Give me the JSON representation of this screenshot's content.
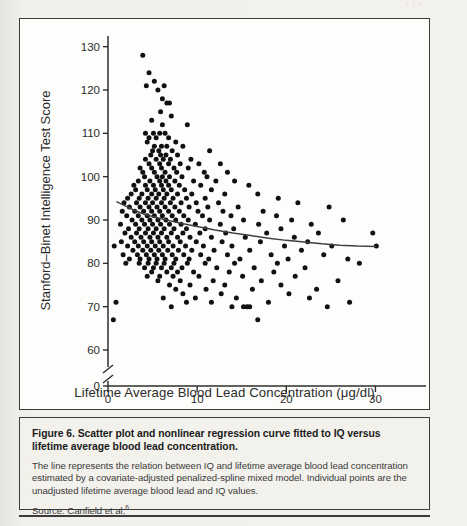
{
  "figure": {
    "bleed_artifact": "f  LP",
    "x_axis_title": "Lifetime Average Blood Lead Concentration (μg/dl)",
    "y_axis_title": "Stanford–Binet Intelligence Test Score"
  },
  "caption": {
    "title": "Figure 6. Scatter plot and nonlinear regression curve fitted to IQ versus lifetime average blood lead concentration.",
    "body": "The line represents the relation between IQ and lifetime average blood lead concentration estimated by a covariate-adjusted penalized-spline mixed model. Individual points are the unadjusted lifetime average blood lead and IQ values.",
    "source_label": "Source: Canfield et al.",
    "source_ref": "6"
  },
  "chart_data": {
    "type": "scatter",
    "title": "Scatter plot and nonlinear regression curve fitted to IQ versus lifetime average blood lead concentration",
    "xlabel": "Lifetime Average Blood Lead Concentration (μg/dl)",
    "ylabel": "Stanford–Binet Intelligence Test Score",
    "xlim": [
      0,
      35
    ],
    "ylim": [
      57,
      132
    ],
    "xticks": [
      0,
      10,
      20,
      30
    ],
    "yticks": [
      60,
      70,
      80,
      90,
      100,
      110,
      120,
      130
    ],
    "y_axis_break": true,
    "y_break_label": "0",
    "grid": false,
    "legend": null,
    "marker": "filled-circle",
    "marker_color": "#111111",
    "line_color": "#404040",
    "n_points": 262,
    "points": [
      [
        3.9,
        128
      ],
      [
        4.6,
        124
      ],
      [
        5.2,
        122
      ],
      [
        4.3,
        121
      ],
      [
        6.3,
        121
      ],
      [
        5.6,
        120
      ],
      [
        6.1,
        118
      ],
      [
        6.6,
        117
      ],
      [
        6.9,
        117
      ],
      [
        5.9,
        115
      ],
      [
        7.1,
        114
      ],
      [
        4.9,
        113
      ],
      [
        6.1,
        112
      ],
      [
        8.9,
        112
      ],
      [
        4.2,
        110
      ],
      [
        5.1,
        110
      ],
      [
        5.8,
        110
      ],
      [
        6.4,
        110
      ],
      [
        4.6,
        109
      ],
      [
        5.4,
        109
      ],
      [
        6.8,
        109
      ],
      [
        7.6,
        108
      ],
      [
        4.4,
        108
      ],
      [
        5.2,
        107
      ],
      [
        6.0,
        107
      ],
      [
        6.6,
        107
      ],
      [
        8.4,
        107
      ],
      [
        5.0,
        106
      ],
      [
        5.7,
        106
      ],
      [
        7.2,
        106
      ],
      [
        4.8,
        105
      ],
      [
        5.9,
        105
      ],
      [
        6.5,
        105
      ],
      [
        7.8,
        105
      ],
      [
        11.4,
        106
      ],
      [
        4.2,
        104
      ],
      [
        5.4,
        104
      ],
      [
        6.2,
        104
      ],
      [
        7.0,
        104
      ],
      [
        9.3,
        104
      ],
      [
        4.6,
        103
      ],
      [
        5.8,
        103
      ],
      [
        6.8,
        103
      ],
      [
        8.1,
        103
      ],
      [
        10.2,
        103
      ],
      [
        3.6,
        102
      ],
      [
        4.9,
        102
      ],
      [
        6.0,
        102
      ],
      [
        7.4,
        102
      ],
      [
        9.0,
        102
      ],
      [
        12.6,
        103
      ],
      [
        3.9,
        101
      ],
      [
        5.2,
        101
      ],
      [
        6.4,
        101
      ],
      [
        7.7,
        101
      ],
      [
        10.8,
        101
      ],
      [
        4.1,
        100
      ],
      [
        5.5,
        100
      ],
      [
        6.1,
        100
      ],
      [
        6.9,
        100
      ],
      [
        8.3,
        100
      ],
      [
        11.1,
        100
      ],
      [
        13.4,
        101
      ],
      [
        3.4,
        99
      ],
      [
        4.7,
        99
      ],
      [
        5.8,
        99
      ],
      [
        6.5,
        99
      ],
      [
        7.5,
        99
      ],
      [
        9.6,
        99
      ],
      [
        12.1,
        99
      ],
      [
        2.9,
        98
      ],
      [
        4.2,
        98
      ],
      [
        5.1,
        98
      ],
      [
        6.0,
        98
      ],
      [
        6.8,
        98
      ],
      [
        8.0,
        98
      ],
      [
        10.4,
        98
      ],
      [
        14.2,
        99
      ],
      [
        3.1,
        97
      ],
      [
        4.4,
        97
      ],
      [
        5.3,
        97
      ],
      [
        6.2,
        97
      ],
      [
        7.1,
        97
      ],
      [
        8.6,
        97
      ],
      [
        11.6,
        97
      ],
      [
        15.8,
        98
      ],
      [
        2.6,
        96
      ],
      [
        3.8,
        96
      ],
      [
        4.9,
        96
      ],
      [
        5.7,
        96
      ],
      [
        6.6,
        96
      ],
      [
        7.8,
        96
      ],
      [
        9.4,
        96
      ],
      [
        13.1,
        96
      ],
      [
        2.2,
        95
      ],
      [
        3.5,
        95
      ],
      [
        4.5,
        95
      ],
      [
        5.4,
        95
      ],
      [
        6.3,
        95
      ],
      [
        7.3,
        95
      ],
      [
        8.8,
        95
      ],
      [
        10.9,
        95
      ],
      [
        16.8,
        96
      ],
      [
        1.8,
        94
      ],
      [
        3.2,
        94
      ],
      [
        4.2,
        94
      ],
      [
        5.0,
        94
      ],
      [
        6.0,
        94
      ],
      [
        7.0,
        94
      ],
      [
        8.2,
        94
      ],
      [
        9.9,
        94
      ],
      [
        12.4,
        94
      ],
      [
        19.1,
        95
      ],
      [
        2.4,
        93
      ],
      [
        3.6,
        93
      ],
      [
        4.6,
        93
      ],
      [
        5.5,
        93
      ],
      [
        6.4,
        93
      ],
      [
        7.5,
        93
      ],
      [
        9.1,
        93
      ],
      [
        11.2,
        93
      ],
      [
        14.6,
        93
      ],
      [
        21.3,
        94
      ],
      [
        1.6,
        92
      ],
      [
        3.0,
        92
      ],
      [
        4.0,
        92
      ],
      [
        4.9,
        92
      ],
      [
        5.8,
        92
      ],
      [
        6.8,
        92
      ],
      [
        8.0,
        92
      ],
      [
        10.1,
        92
      ],
      [
        12.9,
        92
      ],
      [
        17.4,
        92
      ],
      [
        24.8,
        93
      ],
      [
        2.1,
        91
      ],
      [
        3.4,
        91
      ],
      [
        4.4,
        91
      ],
      [
        5.2,
        91
      ],
      [
        6.1,
        91
      ],
      [
        7.2,
        91
      ],
      [
        8.5,
        91
      ],
      [
        10.6,
        91
      ],
      [
        13.8,
        91
      ],
      [
        18.9,
        91
      ],
      [
        2.7,
        90
      ],
      [
        3.8,
        90
      ],
      [
        4.7,
        90
      ],
      [
        5.6,
        90
      ],
      [
        6.5,
        90
      ],
      [
        7.6,
        90
      ],
      [
        9.0,
        90
      ],
      [
        11.4,
        90
      ],
      [
        15.2,
        90
      ],
      [
        20.6,
        90
      ],
      [
        26.4,
        90
      ],
      [
        1.4,
        89
      ],
      [
        3.1,
        89
      ],
      [
        4.1,
        89
      ],
      [
        5.0,
        89
      ],
      [
        5.9,
        89
      ],
      [
        6.9,
        89
      ],
      [
        8.2,
        89
      ],
      [
        9.8,
        89
      ],
      [
        12.6,
        89
      ],
      [
        16.9,
        89
      ],
      [
        22.8,
        89
      ],
      [
        2.3,
        88
      ],
      [
        3.5,
        88
      ],
      [
        4.5,
        88
      ],
      [
        5.4,
        88
      ],
      [
        6.3,
        88
      ],
      [
        7.4,
        88
      ],
      [
        8.8,
        88
      ],
      [
        10.9,
        88
      ],
      [
        14.1,
        88
      ],
      [
        19.4,
        88
      ],
      [
        1.9,
        87
      ],
      [
        3.2,
        87
      ],
      [
        4.2,
        87
      ],
      [
        5.1,
        87
      ],
      [
        6.0,
        87
      ],
      [
        7.1,
        87
      ],
      [
        8.4,
        87
      ],
      [
        10.3,
        87
      ],
      [
        13.2,
        87
      ],
      [
        17.8,
        87
      ],
      [
        23.6,
        87
      ],
      [
        29.7,
        87
      ],
      [
        2.6,
        86
      ],
      [
        3.7,
        86
      ],
      [
        4.7,
        86
      ],
      [
        5.6,
        86
      ],
      [
        6.6,
        86
      ],
      [
        7.8,
        86
      ],
      [
        9.2,
        86
      ],
      [
        11.6,
        86
      ],
      [
        15.4,
        86
      ],
      [
        20.9,
        86
      ],
      [
        1.5,
        85
      ],
      [
        3.0,
        85
      ],
      [
        4.0,
        85
      ],
      [
        4.9,
        85
      ],
      [
        5.8,
        85
      ],
      [
        6.8,
        85
      ],
      [
        8.1,
        85
      ],
      [
        9.9,
        85
      ],
      [
        12.8,
        85
      ],
      [
        17.1,
        85
      ],
      [
        22.4,
        85
      ],
      [
        0.7,
        84
      ],
      [
        2.2,
        84
      ],
      [
        3.4,
        84
      ],
      [
        4.4,
        84
      ],
      [
        5.3,
        84
      ],
      [
        6.2,
        84
      ],
      [
        7.3,
        84
      ],
      [
        8.7,
        84
      ],
      [
        10.7,
        84
      ],
      [
        13.9,
        84
      ],
      [
        19.8,
        84
      ],
      [
        25.1,
        84
      ],
      [
        30.1,
        84
      ],
      [
        2.8,
        83
      ],
      [
        3.9,
        83
      ],
      [
        4.8,
        83
      ],
      [
        5.7,
        83
      ],
      [
        6.7,
        83
      ],
      [
        7.9,
        83
      ],
      [
        9.4,
        83
      ],
      [
        11.9,
        83
      ],
      [
        15.9,
        83
      ],
      [
        21.7,
        83
      ],
      [
        1.7,
        82
      ],
      [
        3.3,
        82
      ],
      [
        4.3,
        82
      ],
      [
        5.2,
        82
      ],
      [
        6.1,
        82
      ],
      [
        7.2,
        82
      ],
      [
        8.5,
        82
      ],
      [
        10.4,
        82
      ],
      [
        13.4,
        82
      ],
      [
        18.3,
        82
      ],
      [
        24.2,
        82
      ],
      [
        2.4,
        81
      ],
      [
        3.6,
        81
      ],
      [
        4.6,
        81
      ],
      [
        5.5,
        81
      ],
      [
        6.4,
        81
      ],
      [
        7.6,
        81
      ],
      [
        9.1,
        81
      ],
      [
        11.3,
        81
      ],
      [
        14.8,
        81
      ],
      [
        20.2,
        81
      ],
      [
        26.9,
        81
      ],
      [
        2.0,
        80
      ],
      [
        3.5,
        80
      ],
      [
        4.5,
        80
      ],
      [
        5.4,
        80
      ],
      [
        6.3,
        80
      ],
      [
        7.4,
        80
      ],
      [
        8.9,
        80
      ],
      [
        10.9,
        80
      ],
      [
        14.2,
        80
      ],
      [
        19.0,
        80
      ],
      [
        28.2,
        80
      ],
      [
        4.1,
        79
      ],
      [
        5.1,
        79
      ],
      [
        6.0,
        79
      ],
      [
        7.1,
        79
      ],
      [
        8.3,
        79
      ],
      [
        12.2,
        79
      ],
      [
        16.4,
        79
      ],
      [
        22.1,
        79
      ],
      [
        4.9,
        78
      ],
      [
        6.6,
        78
      ],
      [
        7.8,
        78
      ],
      [
        9.6,
        78
      ],
      [
        13.6,
        78
      ],
      [
        18.6,
        78
      ],
      [
        4.4,
        77
      ],
      [
        5.8,
        77
      ],
      [
        7.3,
        77
      ],
      [
        10.2,
        77
      ],
      [
        15.1,
        77
      ],
      [
        21.0,
        77
      ],
      [
        5.6,
        76
      ],
      [
        8.1,
        76
      ],
      [
        11.8,
        76
      ],
      [
        17.2,
        76
      ],
      [
        25.8,
        76
      ],
      [
        6.9,
        75
      ],
      [
        9.2,
        75
      ],
      [
        13.1,
        75
      ],
      [
        19.4,
        75
      ],
      [
        7.6,
        74
      ],
      [
        11.0,
        74
      ],
      [
        16.2,
        74
      ],
      [
        23.4,
        74
      ],
      [
        8.4,
        73
      ],
      [
        12.7,
        73
      ],
      [
        20.3,
        73
      ],
      [
        6.2,
        72
      ],
      [
        9.8,
        72
      ],
      [
        14.4,
        72
      ],
      [
        22.6,
        72
      ],
      [
        0.9,
        71
      ],
      [
        8.8,
        71
      ],
      [
        11.6,
        71
      ],
      [
        18.0,
        71
      ],
      [
        27.1,
        71
      ],
      [
        7.1,
        70
      ],
      [
        13.9,
        70
      ],
      [
        15.2,
        70
      ],
      [
        15.6,
        70
      ],
      [
        15.9,
        70
      ],
      [
        24.6,
        70
      ],
      [
        0.6,
        67
      ],
      [
        16.8,
        67
      ]
    ],
    "regression_curve": {
      "description": "covariate-adjusted penalized-spline mixed model fit",
      "points": [
        [
          1.0,
          94.2
        ],
        [
          2.0,
          93.2
        ],
        [
          3.0,
          92.2
        ],
        [
          4.0,
          91.4
        ],
        [
          5.0,
          90.8
        ],
        [
          6.0,
          90.3
        ],
        [
          7.0,
          89.8
        ],
        [
          8.0,
          89.3
        ],
        [
          9.0,
          88.9
        ],
        [
          10.0,
          88.5
        ],
        [
          12.0,
          87.7
        ],
        [
          14.0,
          87.0
        ],
        [
          16.0,
          86.4
        ],
        [
          18.0,
          85.8
        ],
        [
          20.0,
          85.3
        ],
        [
          22.0,
          84.9
        ],
        [
          24.0,
          84.5
        ],
        [
          26.0,
          84.2
        ],
        [
          28.0,
          84.0
        ],
        [
          30.0,
          83.9
        ]
      ]
    }
  }
}
